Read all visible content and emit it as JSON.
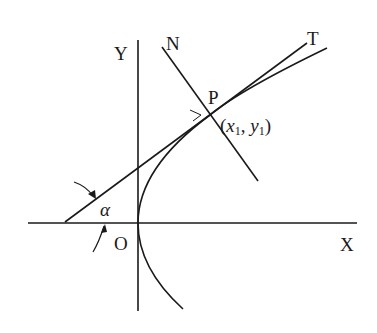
{
  "diagram": {
    "labels": {
      "y_axis": "Y",
      "x_axis": "X",
      "origin": "O",
      "normal": "N",
      "tangent": "T",
      "point": "P",
      "coord_open": "(",
      "x_var": "x",
      "x_sub": "1",
      "comma": ", ",
      "y_var": "y",
      "y_sub": "1",
      "coord_close": ")",
      "angle": "α"
    },
    "colors": {
      "stroke": "#1a1a1a",
      "background": "#ffffff"
    }
  }
}
